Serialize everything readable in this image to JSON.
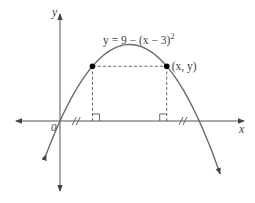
{
  "figure": {
    "equation_label": "y = 9 − (x − 3)",
    "equation_exponent": "2",
    "x_axis_label": "x",
    "y_axis_label": "y",
    "origin_label": "0",
    "point_label": "(x, y)",
    "curve": {
      "a": -1,
      "h": 3,
      "k": 9,
      "x_range": [
        -0.6,
        6.9
      ]
    },
    "marked_point_x": 4.6,
    "colors": {
      "curve": "#6a6a6a",
      "axis": "#555555",
      "point": "#000000"
    }
  }
}
